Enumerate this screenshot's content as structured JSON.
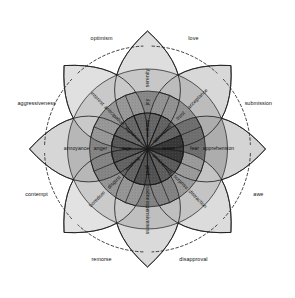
{
  "figure": {
    "type": "radial-diagram",
    "background_color": "#ffffff",
    "outline_color": "#1a1a1a",
    "dashed_arc_color": "#2b2b2b"
  },
  "chart_data": {
    "type": "pie",
    "xlabel": "",
    "ylabel": "",
    "legend_position": "none",
    "grid": false,
    "categories": [
      "joy",
      "trust",
      "fear",
      "surprise",
      "sadness",
      "disgust",
      "anger",
      "anticipation"
    ],
    "values": [
      45,
      45,
      45,
      45,
      45,
      45,
      45,
      45
    ],
    "series": [
      {
        "name": "intense (inner ring)",
        "values": [
          "ecstasy",
          "admiration",
          "terror",
          "amazement",
          "grief",
          "loathing",
          "rage",
          "vigilance"
        ]
      },
      {
        "name": "basic (middle ring)",
        "values": [
          "joy",
          "trust",
          "fear",
          "surprise",
          "sadness",
          "disgust",
          "anger",
          "anticipation"
        ]
      },
      {
        "name": "mild (outer ring)",
        "values": [
          "serenity",
          "acceptance",
          "apprehension",
          "distraction",
          "pensiveness",
          "boredom",
          "annoyance",
          "interest"
        ]
      },
      {
        "name": "dyads (between petals)",
        "values": [
          "love",
          "submission",
          "awe",
          "disapproval",
          "remorse",
          "contempt",
          "aggressiveness",
          "optimism"
        ]
      }
    ]
  },
  "petals": [
    {
      "id": "joy",
      "angle_deg": -90,
      "intense": "ecstasy",
      "basic": "joy",
      "mild": "serenity",
      "colors": {
        "intense": "#6e6e6e",
        "basic": "#8f8f8f",
        "mild": "#c7c7c7",
        "tip": "#dedede"
      }
    },
    {
      "id": "trust",
      "angle_deg": -45,
      "intense": "admiration",
      "basic": "trust",
      "mild": "acceptance",
      "colors": {
        "intense": "#6a6a6a",
        "basic": "#9a9a9a",
        "mild": "#bcbcbc",
        "tip": "#d8d8d8"
      }
    },
    {
      "id": "fear",
      "angle_deg": 0,
      "intense": "terror",
      "basic": "fear",
      "mild": "apprehension",
      "colors": {
        "intense": "#3d3d3d",
        "basic": "#757575",
        "mild": "#adadad",
        "tip": "#d4d4d4"
      }
    },
    {
      "id": "surprise",
      "angle_deg": 45,
      "intense": "amazement",
      "basic": "surprise",
      "mild": "distraction",
      "colors": {
        "intense": "#646464",
        "basic": "#a3a3a3",
        "mild": "#c4c4c4",
        "tip": "#dcdcdc"
      }
    },
    {
      "id": "sadness",
      "angle_deg": 90,
      "intense": "grief",
      "basic": "sadness",
      "mild": "pensiveness",
      "colors": {
        "intense": "#585858",
        "basic": "#8a8a8a",
        "mild": "#bfbfbf",
        "tip": "#dadada"
      }
    },
    {
      "id": "disgust",
      "angle_deg": 135,
      "intense": "loathing",
      "basic": "disgust",
      "mild": "boredom",
      "colors": {
        "intense": "#6b6b6b",
        "basic": "#9e9e9e",
        "mild": "#cacaca",
        "tip": "#e2e2e2"
      }
    },
    {
      "id": "anger",
      "angle_deg": 180,
      "intense": "rage",
      "basic": "anger",
      "mild": "annoyance",
      "colors": {
        "intense": "#5f5f5f",
        "basic": "#8c8c8c",
        "mild": "#b7b7b7",
        "tip": "#d6d6d6"
      }
    },
    {
      "id": "anticipation",
      "angle_deg": -135,
      "intense": "vigilance",
      "basic": "anticipation",
      "mild": "interest",
      "colors": {
        "intense": "#707070",
        "basic": "#a0a0a0",
        "mild": "#c9c9c9",
        "tip": "#e0e0e0"
      }
    }
  ],
  "dyads": [
    {
      "id": "love",
      "label": "love",
      "angle_deg": -67.5
    },
    {
      "id": "submission",
      "label": "submission",
      "angle_deg": -22.5
    },
    {
      "id": "awe",
      "label": "awe",
      "angle_deg": 22.5
    },
    {
      "id": "disapproval",
      "label": "disapproval",
      "angle_deg": 67.5
    },
    {
      "id": "remorse",
      "label": "remorse",
      "angle_deg": 112.5
    },
    {
      "id": "contempt",
      "label": "contempt",
      "angle_deg": 157.5
    },
    {
      "id": "aggressiveness",
      "label": "aggressiveness",
      "angle_deg": 202.5
    },
    {
      "id": "optimism",
      "label": "optimism",
      "angle_deg": 247.5
    }
  ]
}
